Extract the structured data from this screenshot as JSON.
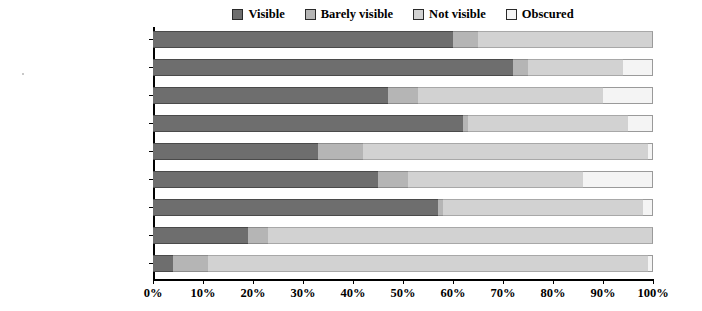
{
  "chart_data": {
    "type": "bar",
    "orientation": "horizontal",
    "stacked": true,
    "normalized": true,
    "title": "",
    "xlabel": "",
    "ylabel": "",
    "xlim": [
      0,
      100
    ],
    "xticks": [
      "0%",
      "10%",
      "20%",
      "30%",
      "40%",
      "50%",
      "60%",
      "70%",
      "80%",
      "90%",
      "100%"
    ],
    "grid": false,
    "legend_position": "top-center",
    "categories": [
      "Wetland",
      "Unclassified",
      "Semi-natural land",
      "Rivers and lakes",
      "Pasture land",
      "Forestry",
      "Developed and urban land",
      "Coastal land",
      "Arable land"
    ],
    "series": [
      {
        "name": "Visible",
        "color": "#6e6e6e",
        "values": [
          60,
          72,
          47,
          62,
          33,
          45,
          57,
          19,
          4
        ]
      },
      {
        "name": "Barely visible",
        "color": "#b5b5b5",
        "values": [
          5,
          3,
          6,
          1,
          9,
          6,
          1,
          4,
          7
        ]
      },
      {
        "name": "Not visible",
        "color": "#d2d2d2",
        "values": [
          35,
          19,
          37,
          32,
          57,
          35,
          40,
          77,
          88
        ]
      },
      {
        "name": "Obscured",
        "color": "#f4f4f4",
        "values": [
          0,
          6,
          10,
          5,
          1,
          14,
          2,
          0,
          1
        ]
      }
    ]
  },
  "legend": {
    "items": [
      {
        "label": "Visible",
        "color": "#6e6e6e"
      },
      {
        "label": "Barely visible",
        "color": "#b5b5b5"
      },
      {
        "label": "Not visible",
        "color": "#d2d2d2"
      },
      {
        "label": "Obscured",
        "color": "#f4f4f4"
      }
    ]
  }
}
